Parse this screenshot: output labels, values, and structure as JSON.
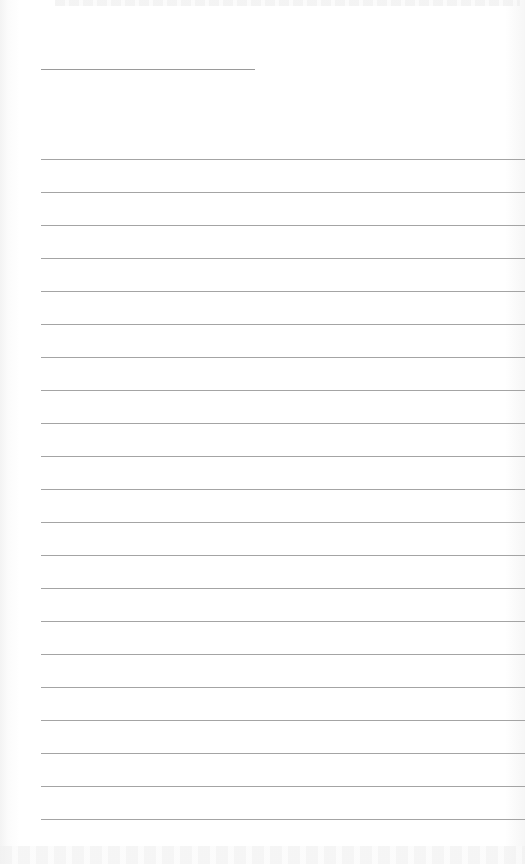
{
  "document": {
    "type": "lined-notebook-page",
    "heading_line": {
      "label": ""
    },
    "ruled_line_count": 21,
    "ruled_lines": [
      "",
      "",
      "",
      "",
      "",
      "",
      "",
      "",
      "",
      "",
      "",
      "",
      "",
      "",
      "",
      "",
      "",
      "",
      "",
      "",
      ""
    ]
  }
}
